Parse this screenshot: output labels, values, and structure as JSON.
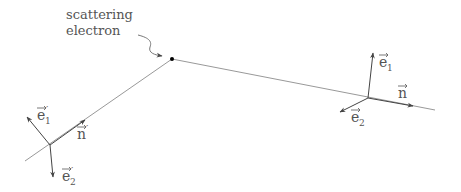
{
  "diagram": {
    "label": {
      "line1": "scattering",
      "line2": "electron"
    },
    "incoming": {
      "e1": "e",
      "e1_sub": "1",
      "e1_prime": "′",
      "e2": "e",
      "e2_sub": "2",
      "e2_prime": "′",
      "n": "n",
      "n_prime": "′"
    },
    "outgoing": {
      "e1": "e",
      "e1_sub": "1",
      "e2": "e",
      "e2_sub": "2",
      "n": "n"
    },
    "colors": {
      "line": "#999999",
      "arrow": "#444444",
      "dot": "#000000",
      "text": "#555555"
    }
  }
}
